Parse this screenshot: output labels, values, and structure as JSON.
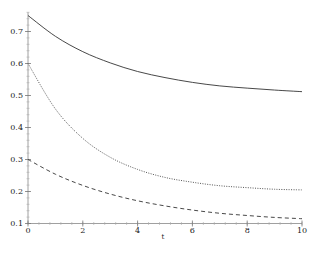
{
  "chart_data": {
    "type": "line",
    "title": "",
    "xlabel": "t",
    "ylabel": "",
    "xlim": [
      0,
      10
    ],
    "ylim": [
      0.1,
      0.76
    ],
    "grid": false,
    "legend": null,
    "x_ticks": [
      0,
      2,
      4,
      6,
      8,
      10
    ],
    "x_tick_labels": [
      "0",
      "2",
      "4",
      "6",
      "8",
      "10"
    ],
    "y_ticks": [
      0.1,
      0.2,
      0.3,
      0.4,
      0.5,
      0.6,
      0.7
    ],
    "y_tick_labels": [
      "0.1",
      "0.2",
      "0.3",
      "0.4",
      "0.5",
      "0.6",
      "0.7"
    ],
    "x": [
      0,
      1,
      2,
      3,
      4,
      5,
      6,
      7,
      8,
      9,
      10
    ],
    "series": [
      {
        "name": "solid",
        "style": "solid",
        "color": "#333333",
        "values": [
          0.75,
          0.685,
          0.637,
          0.602,
          0.575,
          0.556,
          0.541,
          0.53,
          0.523,
          0.517,
          0.512
        ]
      },
      {
        "name": "dotted",
        "style": "dotted",
        "color": "#555555",
        "values": [
          0.6,
          0.458,
          0.366,
          0.307,
          0.269,
          0.244,
          0.229,
          0.218,
          0.212,
          0.207,
          0.205
        ]
      },
      {
        "name": "dashed",
        "style": "dashed",
        "color": "#333333",
        "values": [
          0.3,
          0.254,
          0.219,
          0.192,
          0.171,
          0.155,
          0.142,
          0.132,
          0.125,
          0.119,
          0.115
        ]
      }
    ]
  }
}
